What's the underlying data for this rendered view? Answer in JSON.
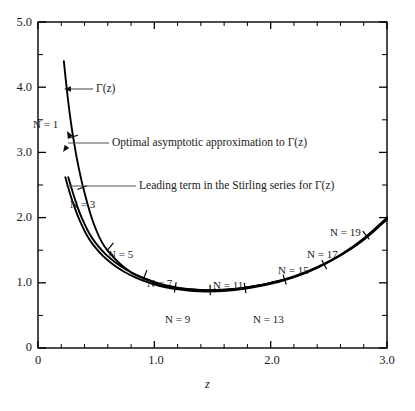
{
  "chart_data": {
    "type": "line",
    "title": "",
    "xlabel": "z",
    "ylabel": "",
    "xlim": [
      0,
      3.0
    ],
    "ylim": [
      0,
      5.0
    ],
    "grid": false,
    "legend_position": "inline-annotations",
    "x_major_ticks": [
      "0",
      "1.0",
      "2.0",
      "3.0"
    ],
    "x_major_values": [
      0,
      1.0,
      2.0,
      3.0
    ],
    "x_minor_step": 0.2,
    "y_major_ticks": [
      "0",
      "1.0",
      "2.0",
      "3.0",
      "4.0",
      "5.0"
    ],
    "y_major_values": [
      0,
      1.0,
      2.0,
      3.0,
      4.0,
      5.0
    ],
    "y_minor_step": 0.5,
    "series": [
      {
        "name": "gamma-function",
        "label": "Γ(z)",
        "points": [
          [
            0.222,
            4.4
          ],
          [
            0.25,
            3.93
          ],
          [
            0.28,
            3.5
          ],
          [
            0.31,
            3.15
          ],
          [
            0.34,
            2.85
          ],
          [
            0.37,
            2.6
          ],
          [
            0.4,
            2.38
          ],
          [
            0.45,
            2.06
          ],
          [
            0.5,
            1.81
          ],
          [
            0.55,
            1.62
          ],
          [
            0.6,
            1.49
          ],
          [
            0.7,
            1.3
          ],
          [
            0.8,
            1.16
          ],
          [
            0.9,
            1.07
          ],
          [
            1.0,
            1.0
          ],
          [
            1.1,
            0.95
          ],
          [
            1.2,
            0.92
          ],
          [
            1.3,
            0.9
          ],
          [
            1.4,
            0.887
          ],
          [
            1.46,
            0.886
          ],
          [
            1.5,
            0.886
          ],
          [
            1.6,
            0.894
          ],
          [
            1.7,
            0.909
          ],
          [
            1.8,
            0.931
          ],
          [
            1.9,
            0.962
          ],
          [
            2.0,
            1.0
          ],
          [
            2.2,
            1.1
          ],
          [
            2.4,
            1.24
          ],
          [
            2.6,
            1.43
          ],
          [
            2.8,
            1.68
          ],
          [
            3.0,
            2.0
          ]
        ]
      },
      {
        "name": "optimal-asymptotic-approximation",
        "label": "Optimal asymptotic approximation to Γ(z)",
        "points": [
          [
            0.26,
            2.62
          ],
          [
            0.3,
            2.38
          ],
          [
            0.34,
            2.16
          ],
          [
            0.38,
            1.98
          ],
          [
            0.44,
            1.76
          ],
          [
            0.5,
            1.6
          ],
          [
            0.58,
            1.44
          ],
          [
            0.66,
            1.32
          ],
          [
            0.76,
            1.2
          ],
          [
            0.86,
            1.11
          ],
          [
            0.96,
            1.04
          ],
          [
            1.06,
            0.98
          ],
          [
            1.16,
            0.94
          ],
          [
            1.26,
            0.91
          ],
          [
            1.36,
            0.893
          ],
          [
            1.46,
            0.886
          ],
          [
            1.56,
            0.889
          ],
          [
            1.66,
            0.9
          ],
          [
            1.76,
            0.919
          ],
          [
            1.86,
            0.947
          ],
          [
            1.96,
            0.982
          ],
          [
            2.1,
            1.04
          ],
          [
            2.26,
            1.13
          ],
          [
            2.42,
            1.25
          ],
          [
            2.58,
            1.4
          ],
          [
            2.74,
            1.58
          ],
          [
            2.88,
            1.78
          ],
          [
            3.0,
            1.99
          ]
        ]
      },
      {
        "name": "leading-term-stirling-series",
        "label": "Leading term in the Stirling series for Γ(z)",
        "points": [
          [
            0.235,
            2.62
          ],
          [
            0.28,
            2.34
          ],
          [
            0.32,
            2.13
          ],
          [
            0.36,
            1.95
          ],
          [
            0.42,
            1.73
          ],
          [
            0.48,
            1.57
          ],
          [
            0.56,
            1.41
          ],
          [
            0.64,
            1.29
          ],
          [
            0.74,
            1.17
          ],
          [
            0.84,
            1.08
          ],
          [
            0.94,
            1.01
          ],
          [
            1.04,
            0.955
          ],
          [
            1.14,
            0.917
          ],
          [
            1.24,
            0.891
          ],
          [
            1.34,
            0.874
          ],
          [
            1.44,
            0.867
          ],
          [
            1.54,
            0.869
          ],
          [
            1.64,
            0.88
          ],
          [
            1.74,
            0.899
          ],
          [
            1.84,
            0.927
          ],
          [
            1.94,
            0.963
          ],
          [
            2.08,
            1.02
          ],
          [
            2.24,
            1.11
          ],
          [
            2.4,
            1.23
          ],
          [
            2.56,
            1.38
          ],
          [
            2.72,
            1.56
          ],
          [
            2.86,
            1.76
          ],
          [
            3.0,
            1.97
          ]
        ]
      }
    ],
    "n_markers": [
      {
        "label": "N = 1",
        "n": 1,
        "z": 0.3,
        "value": 3.24
      },
      {
        "label": "N = 3",
        "n": 3,
        "z": 0.38,
        "value": 2.46
      },
      {
        "label": "N = 5",
        "n": 5,
        "z": 0.62,
        "value": 1.55
      },
      {
        "label": "N = 7",
        "n": 7,
        "z": 0.92,
        "value": 1.12
      },
      {
        "label": "N = 9",
        "n": 9,
        "z": 1.18,
        "value": 0.93
      },
      {
        "label": "N = 11",
        "n": 11,
        "z": 1.48,
        "value": 0.89
      },
      {
        "label": "N = 13",
        "n": 13,
        "z": 1.78,
        "value": 0.92
      },
      {
        "label": "N = 15",
        "n": 15,
        "z": 2.12,
        "value": 1.05
      },
      {
        "label": "N = 17",
        "n": 17,
        "z": 2.46,
        "value": 1.28
      },
      {
        "label": "N = 19",
        "n": 19,
        "z": 2.82,
        "value": 1.73
      }
    ],
    "annotations": [
      {
        "name": "gamma-label",
        "text": "Γ(z)"
      },
      {
        "name": "optimal-label",
        "text": "Optimal asymptotic approximation to Γ(z)"
      },
      {
        "name": "stirling-label",
        "text": "Leading term in the Stirling series for Γ(z)"
      }
    ],
    "colors": {
      "curve": "#000000",
      "axis": "#000000",
      "leader": "#555555",
      "background": "#ffffff"
    }
  },
  "axes": {
    "y_labels": [
      "5.0",
      "4.0",
      "3.0",
      "2.0",
      "1.0",
      "0"
    ],
    "x_labels": [
      "0",
      "1.0",
      "2.0",
      "3.0"
    ],
    "x_axis_name": "z"
  },
  "annotations": {
    "gamma": "Γ(z)",
    "optimal": "Optimal asymptotic approximation to Γ(z)",
    "stirling": "Leading term in the Stirling series for Γ(z)"
  },
  "n_labels": {
    "n1": "N = 1",
    "n3": "N = 3",
    "n5": "N = 5",
    "n7": "N = 7",
    "n9": "N = 9",
    "n11": "N = 11",
    "n13": "N = 13",
    "n15": "N = 15",
    "n17": "N = 17",
    "n19": "N = 19"
  }
}
